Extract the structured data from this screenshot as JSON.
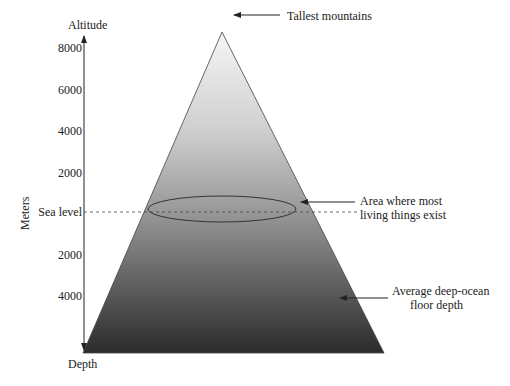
{
  "axis": {
    "top_label": "Altitude",
    "bottom_label": "Depth",
    "unit_label": "Meters",
    "ticks_above": [
      "8000",
      "6000",
      "4000",
      "2000"
    ],
    "sea_level_label": "Sea level",
    "ticks_below": [
      "2000",
      "4000"
    ]
  },
  "annotations": {
    "peak": "Tallest mountains",
    "zone_line1": "Area where most",
    "zone_line2": "living things exist",
    "floor_line1": "Average deep-ocean",
    "floor_line2": "floor depth"
  },
  "colors": {
    "gradient_top": "#f4f4f4",
    "gradient_mid": "#9a9a9a",
    "gradient_bottom": "#2e2e2e",
    "line": "#222222"
  }
}
